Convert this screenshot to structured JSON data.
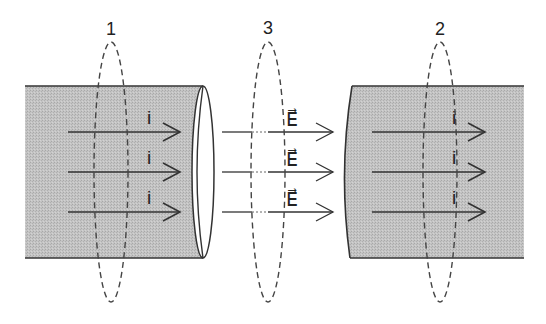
{
  "diagram": {
    "colors": {
      "background": "#ffffff",
      "conductor_fill": "#bdbdbd",
      "stroke": "#333333",
      "dashed": "#444444"
    },
    "surfaces": [
      {
        "label": "1",
        "cx": 111,
        "cy": 172,
        "rx": 17,
        "ry": 130
      },
      {
        "label": "3",
        "cx": 268,
        "cy": 172,
        "rx": 17,
        "ry": 130
      },
      {
        "label": "2",
        "cx": 440,
        "cy": 172,
        "rx": 17,
        "ry": 130
      }
    ],
    "left_conductor": {
      "arrows": [
        {
          "label": "i",
          "y": 132
        },
        {
          "label": "i",
          "y": 172
        },
        {
          "label": "i",
          "y": 212
        }
      ]
    },
    "gap": {
      "arrows": [
        {
          "label": "E⃗",
          "y": 132
        },
        {
          "label": "E⃗",
          "y": 172
        },
        {
          "label": "E⃗",
          "y": 212
        }
      ]
    },
    "right_conductor": {
      "arrows": [
        {
          "label": "i",
          "y": 132
        },
        {
          "label": "i",
          "y": 172
        },
        {
          "label": "i",
          "y": 212
        }
      ]
    }
  }
}
